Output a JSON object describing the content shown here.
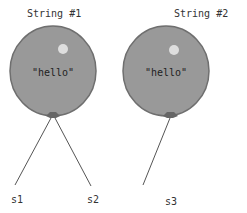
{
  "diagram": {
    "balloons": [
      {
        "title": "String #1",
        "value": "\"hello\"",
        "variables": [
          "s1",
          "s2"
        ]
      },
      {
        "title": "String #2",
        "value": "\"hello\"",
        "variables": [
          "s3"
        ]
      }
    ],
    "colors": {
      "balloon_fill": "#999999",
      "balloon_stroke": "#6f6f6f",
      "highlight": "#dedede",
      "string": "#555555"
    }
  }
}
